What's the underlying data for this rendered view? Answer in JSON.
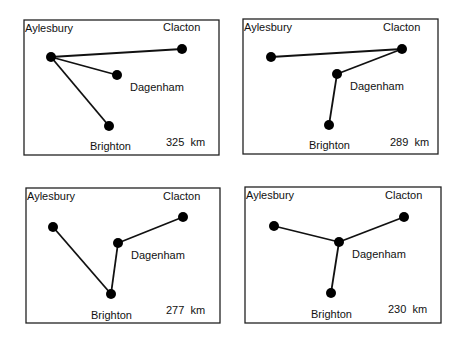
{
  "panels": [
    {
      "id": "panel-1",
      "distance": "325  km",
      "frame": {
        "x": 24,
        "y": 20,
        "w": 195,
        "h": 135
      },
      "nodes": {
        "aylesbury": {
          "label": "Aylesbury",
          "x": 51,
          "y": 57
        },
        "clacton": {
          "label": "Clacton",
          "x": 182,
          "y": 49
        },
        "dagenham": {
          "label": "Dagenham",
          "x": 117,
          "y": 75
        },
        "brighton": {
          "label": "Brighton",
          "x": 109,
          "y": 126
        }
      },
      "labels": {
        "aylesbury": {
          "x": 25,
          "y": 32
        },
        "clacton": {
          "x": 163,
          "y": 31
        },
        "dagenham": {
          "x": 130,
          "y": 91
        },
        "brighton": {
          "x": 90,
          "y": 150
        },
        "distance": {
          "x": 166,
          "y": 146
        }
      },
      "edges": [
        [
          "aylesbury",
          "clacton"
        ],
        [
          "aylesbury",
          "dagenham"
        ],
        [
          "aylesbury",
          "brighton"
        ]
      ]
    },
    {
      "id": "panel-2",
      "distance": "289  km",
      "frame": {
        "x": 243,
        "y": 19,
        "w": 195,
        "h": 135
      },
      "nodes": {
        "aylesbury": {
          "label": "Aylesbury",
          "x": 271,
          "y": 57
        },
        "clacton": {
          "label": "Clacton",
          "x": 402,
          "y": 49
        },
        "dagenham": {
          "label": "Dagenham",
          "x": 337,
          "y": 74
        },
        "brighton": {
          "label": "Brighton",
          "x": 329,
          "y": 125
        }
      },
      "labels": {
        "aylesbury": {
          "x": 244,
          "y": 31
        },
        "clacton": {
          "x": 383,
          "y": 31
        },
        "dagenham": {
          "x": 350,
          "y": 90
        },
        "brighton": {
          "x": 309,
          "y": 149
        },
        "distance": {
          "x": 390,
          "y": 146
        }
      },
      "edges": [
        [
          "aylesbury",
          "clacton"
        ],
        [
          "clacton",
          "dagenham"
        ],
        [
          "dagenham",
          "brighton"
        ]
      ]
    },
    {
      "id": "panel-3",
      "distance": "277  km",
      "frame": {
        "x": 26,
        "y": 188,
        "w": 194,
        "h": 135
      },
      "nodes": {
        "aylesbury": {
          "label": "Aylesbury",
          "x": 53,
          "y": 227
        },
        "clacton": {
          "label": "Clacton",
          "x": 183,
          "y": 217
        },
        "dagenham": {
          "label": "Dagenham",
          "x": 118,
          "y": 243
        },
        "brighton": {
          "label": "Brighton",
          "x": 111,
          "y": 294
        }
      },
      "labels": {
        "aylesbury": {
          "x": 27,
          "y": 200
        },
        "clacton": {
          "x": 163,
          "y": 200
        },
        "dagenham": {
          "x": 131,
          "y": 259
        },
        "brighton": {
          "x": 91,
          "y": 319
        },
        "distance": {
          "x": 166,
          "y": 314
        }
      },
      "edges": [
        [
          "aylesbury",
          "brighton"
        ],
        [
          "brighton",
          "dagenham"
        ],
        [
          "dagenham",
          "clacton"
        ]
      ]
    },
    {
      "id": "panel-4",
      "distance": "230  km",
      "frame": {
        "x": 245,
        "y": 187,
        "w": 196,
        "h": 136
      },
      "nodes": {
        "aylesbury": {
          "label": "Aylesbury",
          "x": 274,
          "y": 226
        },
        "clacton": {
          "label": "Clacton",
          "x": 404,
          "y": 217
        },
        "dagenham": {
          "label": "Dagenham",
          "x": 339,
          "y": 242
        },
        "brighton": {
          "label": "Brighton",
          "x": 331,
          "y": 293
        }
      },
      "labels": {
        "aylesbury": {
          "x": 246,
          "y": 199
        },
        "clacton": {
          "x": 385,
          "y": 199
        },
        "dagenham": {
          "x": 352,
          "y": 258
        },
        "brighton": {
          "x": 311,
          "y": 318
        },
        "distance": {
          "x": 388,
          "y": 313
        }
      },
      "edges": [
        [
          "aylesbury",
          "dagenham"
        ],
        [
          "clacton",
          "dagenham"
        ],
        [
          "brighton",
          "dagenham"
        ]
      ]
    }
  ]
}
